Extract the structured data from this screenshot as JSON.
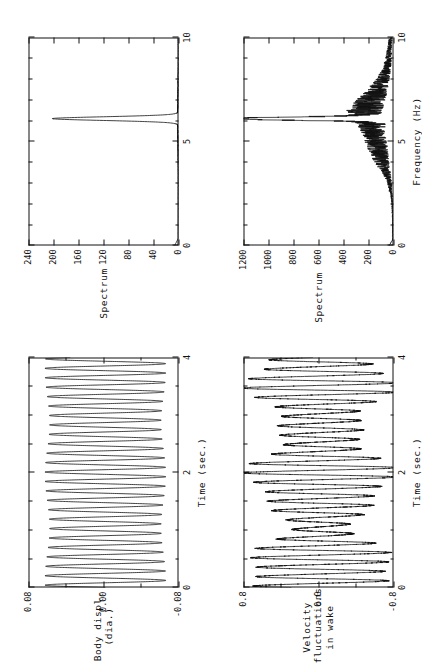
{
  "figure": {
    "orientation": "rotated-90-ccw",
    "panel_count": 4,
    "line_color": "#111111",
    "background": "#ffffff"
  },
  "panels": {
    "body_time": {
      "name": "Body displacement time trace",
      "ytitle_line1": "Body displ.",
      "ytitle_line2": "(dia.)",
      "xtitle": "Time (sec.)",
      "yticks": [
        "0.08",
        "0.00",
        "-0.08"
      ],
      "xticks": [
        "0",
        "2",
        "4"
      ]
    },
    "body_spectrum": {
      "name": "Body displacement spectrum",
      "ytitle": "Spectrum",
      "xtitle": "",
      "yticks": [
        "240",
        "200",
        "160",
        "120",
        "80",
        "40",
        "0"
      ],
      "xticks": [
        "0",
        "5",
        "10"
      ]
    },
    "wake_time": {
      "name": "Wake velocity time trace",
      "ytitle_line1": "Velocity",
      "ytitle_line2": "fluctuations",
      "ytitle_line3": "in wake",
      "xtitle": "Time (sec.)",
      "yticks": [
        "0.8",
        "0.0",
        "-0.8"
      ],
      "xticks": [
        "0",
        "2",
        "4"
      ]
    },
    "wake_spectrum": {
      "name": "Wake velocity spectrum",
      "ytitle": "Spectrum",
      "xtitle": "Frequency (Hz)",
      "yticks": [
        "1200",
        "1000",
        "800",
        "600",
        "400",
        "200",
        "0"
      ],
      "xticks": [
        "0",
        "5",
        "10"
      ]
    }
  },
  "chart_data": [
    {
      "type": "line",
      "id": "body-displacement-time",
      "title": "",
      "xlabel": "Time (sec.)",
      "ylabel": "Body displ. (dia.)",
      "xlim": [
        0,
        4
      ],
      "ylim": [
        -0.08,
        0.08
      ],
      "xticks": [
        0,
        2,
        4
      ],
      "yticks": [
        -0.08,
        0.0,
        0.08
      ],
      "grid": false,
      "legend": "none",
      "description": "Near-sinusoidal body oscillation at ~6.1 Hz, nearly constant amplitude ~0.062 dia.",
      "model": {
        "kind": "sine",
        "frequency_hz": 6.1,
        "amplitude": 0.062,
        "mean": -0.002,
        "phase": 0.0,
        "amplitude_modulation": 0.04,
        "modulation_hz": 0.55
      }
    },
    {
      "type": "line",
      "id": "body-displacement-spectrum",
      "title": "",
      "xlabel": "Frequency (Hz)",
      "ylabel": "Spectrum",
      "xlim": [
        0,
        10
      ],
      "ylim": [
        0,
        240
      ],
      "xticks": [
        0,
        5,
        10
      ],
      "yticks": [
        0,
        40,
        80,
        120,
        160,
        200,
        240
      ],
      "grid": false,
      "legend": "none",
      "description": "Single very sharp spectral peak at 6.1 Hz reaching ~200; negligible elsewhere.",
      "peaks": [
        {
          "frequency_hz": 6.1,
          "amplitude": 200,
          "width_hz": 0.12
        }
      ],
      "noise_floor": 2
    },
    {
      "type": "line",
      "id": "wake-velocity-time",
      "title": "",
      "xlabel": "Time (sec.)",
      "ylabel": "Velocity fluctuations in wake",
      "xlim": [
        0,
        4
      ],
      "ylim": [
        -0.8,
        0.8
      ],
      "xticks": [
        0,
        2,
        4
      ],
      "yticks": [
        -0.8,
        0.0,
        0.8
      ],
      "grid": false,
      "legend": "none",
      "description": "Oscillation at ~6.1 Hz with strong amplitude modulation (beating) between ~0.35 and ~0.75.",
      "model": {
        "kind": "sine",
        "frequency_hz": 6.1,
        "amplitude": 0.55,
        "mean": -0.02,
        "phase": 0.4,
        "amplitude_modulation": 0.36,
        "modulation_hz": 0.62,
        "noise": 0.05
      }
    },
    {
      "type": "line",
      "id": "wake-velocity-spectrum",
      "title": "",
      "xlabel": "Frequency (Hz)",
      "ylabel": "Spectrum",
      "xlim": [
        0,
        10
      ],
      "ylim": [
        0,
        1200
      ],
      "xticks": [
        0,
        5,
        10
      ],
      "yticks": [
        0,
        200,
        400,
        600,
        800,
        1000,
        1200
      ],
      "grid": false,
      "legend": "none",
      "description": "Dominant sharp peak at 6.1 Hz reaching ~1130, on a broadband noisy background rising to ~200 between 4 and 8 Hz and decaying above 8 Hz.",
      "peaks": [
        {
          "frequency_hz": 6.1,
          "amplitude": 1130,
          "width_hz": 0.1
        }
      ],
      "broadband": [
        {
          "frequency_hz": 0.0,
          "amplitude": 5
        },
        {
          "frequency_hz": 1.0,
          "amplitude": 8
        },
        {
          "frequency_hz": 2.0,
          "amplitude": 12
        },
        {
          "frequency_hz": 3.0,
          "amplitude": 30
        },
        {
          "frequency_hz": 3.5,
          "amplitude": 55
        },
        {
          "frequency_hz": 4.0,
          "amplitude": 95
        },
        {
          "frequency_hz": 4.5,
          "amplitude": 120
        },
        {
          "frequency_hz": 5.0,
          "amplitude": 140
        },
        {
          "frequency_hz": 5.5,
          "amplitude": 160
        },
        {
          "frequency_hz": 6.0,
          "amplitude": 190
        },
        {
          "frequency_hz": 6.5,
          "amplitude": 230
        },
        {
          "frequency_hz": 7.0,
          "amplitude": 180
        },
        {
          "frequency_hz": 7.5,
          "amplitude": 130
        },
        {
          "frequency_hz": 8.0,
          "amplitude": 85
        },
        {
          "frequency_hz": 8.5,
          "amplitude": 55
        },
        {
          "frequency_hz": 9.0,
          "amplitude": 40
        },
        {
          "frequency_hz": 9.5,
          "amplitude": 30
        },
        {
          "frequency_hz": 10.0,
          "amplitude": 25
        }
      ]
    }
  ]
}
